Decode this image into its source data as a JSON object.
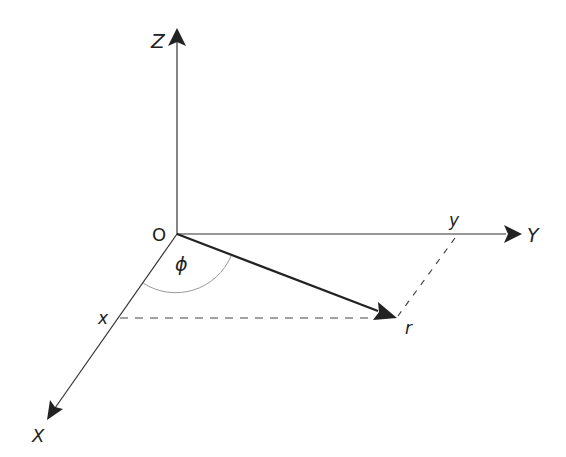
{
  "diagram": {
    "title": "",
    "type": "3d-coordinate-vector",
    "labels": {
      "z_axis": "Z",
      "y_axis": "Y",
      "x_axis": "X",
      "origin": "O",
      "angle": "ϕ",
      "x_component": "x",
      "y_component": "y",
      "vector": "r"
    },
    "colors": {
      "axis": "#333333",
      "vector": "#222222",
      "dashed": "#444444",
      "arc": "#999999",
      "text": "#222222"
    },
    "geometry": {
      "origin": [
        177,
        234
      ],
      "z_end": [
        177,
        38
      ],
      "y_end": [
        518,
        234
      ],
      "x_end": [
        48,
        418
      ],
      "r_end": [
        395,
        318
      ],
      "x_point": [
        118,
        318
      ],
      "y_point": [
        455,
        234
      ]
    }
  }
}
